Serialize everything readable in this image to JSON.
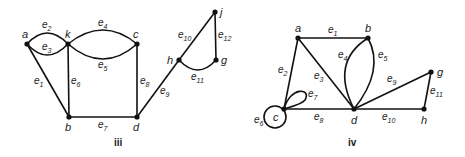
{
  "figures": [
    {
      "caption": "iii",
      "vertices": {
        "a": "a",
        "k": "k",
        "c": "c",
        "b": "b",
        "d": "d",
        "h": "h",
        "g": "g",
        "j": "j"
      },
      "edges": [
        {
          "id": "e1",
          "base": "e",
          "sub": "1",
          "from": "a",
          "to": "b"
        },
        {
          "id": "e2",
          "base": "e",
          "sub": "2",
          "from": "a",
          "to": "k"
        },
        {
          "id": "e3",
          "base": "e",
          "sub": "3",
          "from": "a",
          "to": "k"
        },
        {
          "id": "e4",
          "base": "e",
          "sub": "4",
          "from": "k",
          "to": "c"
        },
        {
          "id": "e5",
          "base": "e",
          "sub": "5",
          "from": "k",
          "to": "c"
        },
        {
          "id": "e6",
          "base": "e",
          "sub": "6",
          "from": "k",
          "to": "b"
        },
        {
          "id": "e7",
          "base": "e",
          "sub": "7",
          "from": "b",
          "to": "d"
        },
        {
          "id": "e8",
          "base": "e",
          "sub": "8",
          "from": "c",
          "to": "d"
        },
        {
          "id": "e9",
          "base": "e",
          "sub": "9",
          "from": "d",
          "to": "h"
        },
        {
          "id": "e10",
          "base": "e",
          "sub": "10",
          "from": "h",
          "to": "j"
        },
        {
          "id": "e11",
          "base": "e",
          "sub": "11",
          "from": "h",
          "to": "g"
        },
        {
          "id": "e12",
          "base": "e",
          "sub": "12",
          "from": "j",
          "to": "g"
        }
      ]
    },
    {
      "caption": "iv",
      "vertices": {
        "a": "a",
        "b": "b",
        "c": "c",
        "d": "d",
        "g": "g",
        "h": "h"
      },
      "edges": [
        {
          "id": "e1",
          "base": "e",
          "sub": "1",
          "from": "a",
          "to": "b"
        },
        {
          "id": "e2",
          "base": "e",
          "sub": "2",
          "from": "a",
          "to": "c"
        },
        {
          "id": "e3",
          "base": "e",
          "sub": "3",
          "from": "a",
          "to": "d"
        },
        {
          "id": "e4",
          "base": "e",
          "sub": "4",
          "from": "b",
          "to": "d"
        },
        {
          "id": "e5",
          "base": "e",
          "sub": "5",
          "from": "b",
          "to": "d"
        },
        {
          "id": "e6",
          "base": "e",
          "sub": "6",
          "from": "c",
          "to": "c"
        },
        {
          "id": "e7",
          "base": "e",
          "sub": "7",
          "from": "c",
          "to": "c"
        },
        {
          "id": "e8",
          "base": "e",
          "sub": "8",
          "from": "c",
          "to": "d"
        },
        {
          "id": "e9",
          "base": "e",
          "sub": "9",
          "from": "d",
          "to": "g"
        },
        {
          "id": "e10",
          "base": "e",
          "sub": "10",
          "from": "d",
          "to": "h"
        },
        {
          "id": "e11",
          "base": "e",
          "sub": "11",
          "from": "g",
          "to": "h"
        }
      ]
    }
  ]
}
